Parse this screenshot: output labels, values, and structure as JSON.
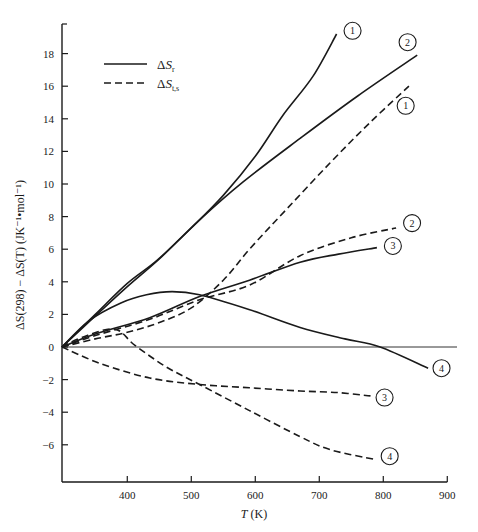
{
  "chart_data": {
    "type": "line",
    "title": "",
    "xlabel": "T (K)",
    "ylabel": "ΔS(298) − ΔS(T) (JK⁻¹•mol⁻¹)",
    "xlim": [
      298,
      900
    ],
    "ylim": [
      -8,
      20
    ],
    "xticks": [
      400,
      500,
      600,
      700,
      800,
      900
    ],
    "yticks": [
      -6,
      -4,
      -2,
      0,
      2,
      4,
      6,
      8,
      10,
      12,
      14,
      16,
      18
    ],
    "grid": false,
    "legend": {
      "position": "upper-left",
      "entries": [
        {
          "label": "ΔS",
          "subscript": "r",
          "style": "solid"
        },
        {
          "label": "ΔS",
          "subscript": "t,s",
          "style": "dashed"
        }
      ]
    },
    "reference_line": {
      "y": 0,
      "x_end": 930
    },
    "series": [
      {
        "name": "ΔS_r curve 1",
        "label": "1",
        "style": "solid",
        "x": [
          298,
          350,
          400,
          446,
          500,
          550,
          600,
          643,
          690,
          727
        ],
        "y": [
          0,
          2.0,
          3.9,
          5.3,
          7.3,
          9.3,
          11.7,
          14.2,
          16.6,
          19.2
        ],
        "label_pos": [
          752,
          19.4
        ]
      },
      {
        "name": "ΔS_r curve 2",
        "label": "2",
        "style": "solid",
        "x": [
          298,
          350,
          400,
          450,
          513,
          580,
          670,
          760,
          853
        ],
        "y": [
          0,
          1.9,
          3.7,
          5.4,
          7.8,
          10.1,
          12.8,
          15.4,
          17.9
        ],
        "label_pos": [
          838,
          18.7
        ]
      },
      {
        "name": "ΔS_t,s curve 1",
        "label": "1",
        "style": "dashed",
        "x": [
          298,
          350,
          400,
          450,
          500,
          550,
          591,
          650,
          717,
          780,
          840
        ],
        "y": [
          0,
          0.5,
          0.9,
          1.5,
          2.4,
          4.1,
          6.0,
          8.5,
          11.3,
          13.8,
          16.0
        ],
        "label_pos": [
          835,
          14.8
        ]
      },
      {
        "name": "ΔS_t,s curve 2",
        "label": "2",
        "style": "dashed",
        "x": [
          298,
          350,
          435,
          513,
          591,
          670,
          750,
          820
        ],
        "y": [
          0,
          0.7,
          1.7,
          2.9,
          3.8,
          5.6,
          6.7,
          7.3
        ],
        "label_pos": [
          845,
          7.6
        ]
      },
      {
        "name": "ΔS_r curve 3",
        "label": "3",
        "style": "solid",
        "x": [
          298,
          350,
          435,
          513,
          591,
          670,
          730,
          790
        ],
        "y": [
          0,
          0.8,
          1.8,
          3.1,
          4.1,
          5.2,
          5.7,
          6.1
        ],
        "label_pos": [
          815,
          6.2
        ]
      },
      {
        "name": "ΔS_r curve 4",
        "label": "4",
        "style": "solid",
        "x": [
          298,
          340,
          390,
          430,
          470,
          513,
          590,
          670,
          740,
          795,
          870
        ],
        "y": [
          0,
          1.6,
          2.7,
          3.2,
          3.4,
          3.2,
          2.3,
          1.2,
          0.5,
          0.0,
          -1.3
        ],
        "label_pos": [
          891,
          -1.3
        ]
      },
      {
        "name": "ΔS_t,s curve 3",
        "label": "3",
        "style": "dashed",
        "x": [
          298,
          357,
          435,
          513,
          591,
          670,
          730,
          780
        ],
        "y": [
          0,
          -1.0,
          -1.9,
          -2.3,
          -2.5,
          -2.7,
          -2.8,
          -3.0
        ],
        "label_pos": [
          802,
          -3.1
        ]
      },
      {
        "name": "ΔS_t,s curve 4",
        "label": "4",
        "style": "dashed",
        "x": [
          298,
          330,
          380,
          412,
          460,
          513,
          591,
          670,
          717,
          787
        ],
        "y": [
          0,
          0.6,
          1.1,
          0.1,
          -1.2,
          -2.3,
          -3.9,
          -5.5,
          -6.3,
          -6.9
        ],
        "label_pos": [
          810,
          -6.7
        ]
      }
    ]
  },
  "axes": {
    "x_title_italic": "T",
    "x_title_rest": " (K)",
    "y_title": "ΔS(298) − ΔS(T) (JK⁻¹•mol⁻¹)"
  }
}
